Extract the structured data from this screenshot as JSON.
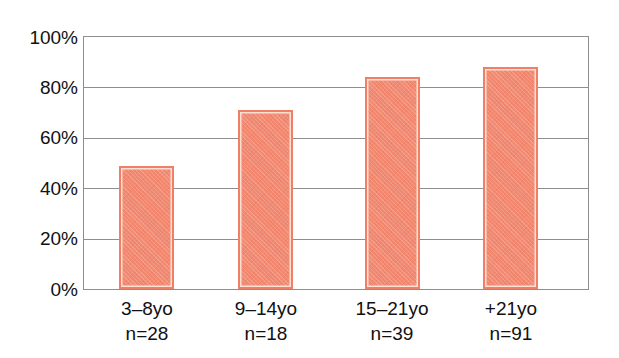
{
  "chart_data": {
    "type": "bar",
    "title": "",
    "subtitle": "",
    "xlabel": "",
    "ylabel": "",
    "categories": [
      "3–8yo",
      "9–14yo",
      "15–21yo",
      "+21yo"
    ],
    "group_sizes": [
      "n=28",
      "n=18",
      "n=39",
      "n=91"
    ],
    "values": [
      49,
      71,
      84,
      88
    ],
    "ylim": [
      0,
      100
    ],
    "ytick_values": [
      0,
      20,
      40,
      60,
      80,
      100
    ],
    "ytick_labels": [
      "0%",
      "20%",
      "40%",
      "60%",
      "80%",
      "100%"
    ],
    "grid": "horizontal",
    "legend": "none",
    "series": [
      {
        "name": "",
        "values": [
          49,
          71,
          84,
          88
        ]
      }
    ],
    "colors": {
      "bar_fill": "#f28a72",
      "bar_border": "#ef7f66",
      "bar_inner_highlight": "#fbe0d2",
      "gridline": "#8e8e8e",
      "axis": "#8e8e8e",
      "text": "#111111",
      "background": "#ffffff"
    }
  },
  "axis": {
    "y": {
      "ticks": [
        {
          "label": "100%",
          "value": 100
        },
        {
          "label": "80%",
          "value": 80
        },
        {
          "label": "60%",
          "value": 60
        },
        {
          "label": "40%",
          "value": 40
        },
        {
          "label": "20%",
          "value": 20
        },
        {
          "label": "0%",
          "value": 0
        }
      ]
    },
    "x": {
      "ticks": [
        {
          "category": "3–8yo",
          "n": "n=28"
        },
        {
          "category": "9–14yo",
          "n": "n=18"
        },
        {
          "category": "15–21yo",
          "n": "n=39"
        },
        {
          "category": "+21yo",
          "n": "n=91"
        }
      ]
    }
  }
}
